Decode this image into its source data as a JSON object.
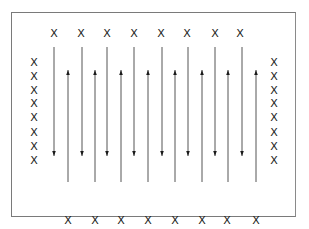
{
  "diagram": {
    "marker_glyph": "X",
    "colors": {
      "line": "#555555",
      "marker": "#1a1a1a",
      "border": "#7a7a7a"
    },
    "top_row": {
      "count": 8,
      "y": 37,
      "xs": [
        54,
        81,
        107,
        134,
        161,
        187,
        215,
        240
      ]
    },
    "bottom_row": {
      "count": 8,
      "y": 224,
      "xs": [
        68,
        95,
        121,
        148,
        175,
        202,
        227,
        256
      ]
    },
    "left_column": {
      "count": 8,
      "x": 34,
      "ys": [
        66,
        80,
        94,
        107,
        121,
        136,
        150,
        164
      ]
    },
    "right_column": {
      "count": 8,
      "x": 274,
      "ys": [
        66,
        80,
        94,
        107,
        121,
        136,
        150,
        164
      ]
    },
    "down_arrows": [
      {
        "x": 54,
        "y1": 47,
        "y2": 156
      },
      {
        "x": 82,
        "y1": 47,
        "y2": 156
      },
      {
        "x": 107,
        "y1": 47,
        "y2": 156
      },
      {
        "x": 134,
        "y1": 47,
        "y2": 156
      },
      {
        "x": 162,
        "y1": 47,
        "y2": 156
      },
      {
        "x": 188,
        "y1": 47,
        "y2": 156
      },
      {
        "x": 215,
        "y1": 47,
        "y2": 156
      },
      {
        "x": 242,
        "y1": 47,
        "y2": 156
      }
    ],
    "up_arrows": [
      {
        "x": 68,
        "y1": 182,
        "y2": 70
      },
      {
        "x": 95,
        "y1": 182,
        "y2": 70
      },
      {
        "x": 121,
        "y1": 182,
        "y2": 70
      },
      {
        "x": 148,
        "y1": 182,
        "y2": 70
      },
      {
        "x": 175,
        "y1": 182,
        "y2": 70
      },
      {
        "x": 202,
        "y1": 182,
        "y2": 70
      },
      {
        "x": 228,
        "y1": 182,
        "y2": 70
      },
      {
        "x": 256,
        "y1": 182,
        "y2": 70
      }
    ]
  }
}
